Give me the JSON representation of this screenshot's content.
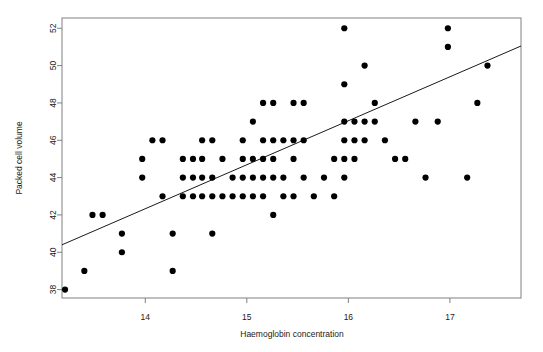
{
  "chart_data": {
    "type": "scatter",
    "title": "",
    "xlabel": "Haemoglobin concentration",
    "ylabel": "Packed cell volume",
    "xlim": [
      13.18,
      17.7
    ],
    "ylim": [
      37.55,
      52.55
    ],
    "xticks": [
      14,
      15,
      16,
      17
    ],
    "yticks": [
      38,
      40,
      42,
      44,
      46,
      48,
      50,
      52
    ],
    "grid": false,
    "legend": null,
    "point_color": "#000000",
    "point_marker": "filled-circle",
    "point_size_px": 3.1,
    "frame_color": "#808080",
    "background": "#ffffff",
    "fit_line": {
      "type": "linear-regression",
      "color": "#1a1a1a",
      "x_start": 13.18,
      "y_start": 40.4,
      "x_end": 17.7,
      "y_end": 51.05
    },
    "points": [
      [
        13.21,
        38.0
      ],
      [
        13.4,
        39.0
      ],
      [
        13.48,
        42.0
      ],
      [
        13.58,
        42.0
      ],
      [
        13.77,
        41.0
      ],
      [
        13.77,
        40.0
      ],
      [
        13.97,
        45.0
      ],
      [
        13.97,
        44.0
      ],
      [
        14.07,
        46.0
      ],
      [
        14.17,
        46.0
      ],
      [
        14.17,
        43.0
      ],
      [
        14.27,
        41.0
      ],
      [
        14.27,
        39.0
      ],
      [
        14.37,
        45.0
      ],
      [
        14.37,
        44.0
      ],
      [
        14.37,
        43.0
      ],
      [
        14.47,
        45.0
      ],
      [
        14.47,
        44.0
      ],
      [
        14.47,
        43.0
      ],
      [
        14.56,
        46.0
      ],
      [
        14.56,
        45.0
      ],
      [
        14.56,
        44.0
      ],
      [
        14.56,
        43.0
      ],
      [
        14.66,
        46.0
      ],
      [
        14.66,
        44.0
      ],
      [
        14.66,
        43.0
      ],
      [
        14.66,
        41.0
      ],
      [
        14.76,
        45.0
      ],
      [
        14.76,
        43.0
      ],
      [
        14.86,
        44.0
      ],
      [
        14.86,
        43.0
      ],
      [
        14.96,
        46.0
      ],
      [
        14.96,
        45.0
      ],
      [
        14.96,
        44.0
      ],
      [
        14.96,
        43.0
      ],
      [
        15.06,
        47.0
      ],
      [
        15.06,
        45.0
      ],
      [
        15.06,
        44.0
      ],
      [
        15.06,
        43.0
      ],
      [
        15.16,
        48.0
      ],
      [
        15.16,
        46.0
      ],
      [
        15.16,
        45.0
      ],
      [
        15.16,
        44.0
      ],
      [
        15.16,
        43.0
      ],
      [
        15.26,
        48.0
      ],
      [
        15.26,
        46.0
      ],
      [
        15.26,
        45.0
      ],
      [
        15.26,
        44.0
      ],
      [
        15.26,
        42.0
      ],
      [
        15.36,
        46.0
      ],
      [
        15.36,
        44.0
      ],
      [
        15.36,
        43.0
      ],
      [
        15.46,
        48.0
      ],
      [
        15.46,
        46.0
      ],
      [
        15.46,
        45.0
      ],
      [
        15.46,
        43.0
      ],
      [
        15.56,
        48.0
      ],
      [
        15.56,
        46.0
      ],
      [
        15.56,
        44.0
      ],
      [
        15.66,
        43.0
      ],
      [
        15.76,
        44.0
      ],
      [
        15.86,
        45.0
      ],
      [
        15.86,
        43.0
      ],
      [
        15.96,
        52.0
      ],
      [
        15.96,
        49.0
      ],
      [
        15.96,
        47.0
      ],
      [
        15.96,
        46.0
      ],
      [
        15.96,
        45.0
      ],
      [
        15.96,
        44.0
      ],
      [
        16.06,
        47.0
      ],
      [
        16.06,
        46.0
      ],
      [
        16.06,
        45.0
      ],
      [
        16.16,
        50.0
      ],
      [
        16.16,
        47.0
      ],
      [
        16.16,
        46.0
      ],
      [
        16.26,
        48.0
      ],
      [
        16.26,
        47.0
      ],
      [
        16.36,
        46.0
      ],
      [
        16.46,
        45.0
      ],
      [
        16.56,
        45.0
      ],
      [
        16.66,
        47.0
      ],
      [
        16.76,
        44.0
      ],
      [
        16.98,
        52.0
      ],
      [
        16.98,
        51.0
      ],
      [
        16.88,
        47.0
      ],
      [
        17.37,
        50.0
      ],
      [
        17.27,
        48.0
      ],
      [
        17.17,
        44.0
      ]
    ]
  },
  "figure": {
    "x_axis_label": "Haemoglobin concentration",
    "y_axis_label": "Packed cell volume",
    "x_tick_labels": [
      "14",
      "15",
      "16",
      "17"
    ],
    "y_tick_labels": [
      "38",
      "40",
      "42",
      "44",
      "46",
      "48",
      "50",
      "52"
    ]
  }
}
